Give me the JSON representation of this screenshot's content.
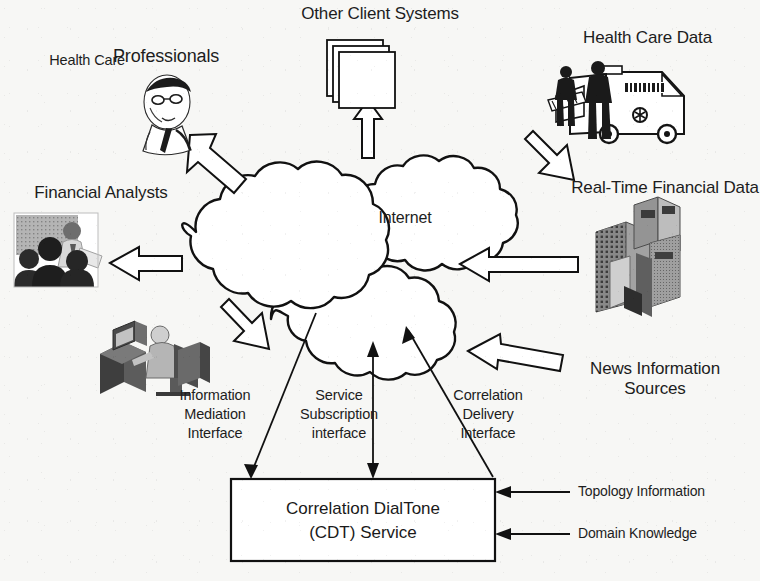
{
  "diagram": {
    "title_text": "Correlation DialTone architecture",
    "center": {
      "cloud_label": "Internet"
    },
    "nodes": [
      {
        "id": "other-client-systems",
        "label": "Other Client Systems",
        "icon": "stacked-windows-icon"
      },
      {
        "id": "health-care-professionals-small",
        "label": "Health Care"
      },
      {
        "id": "health-care-professionals-big",
        "label": "Professionals",
        "icon": "doctor-portrait-icon"
      },
      {
        "id": "health-care-data",
        "label": "Health Care Data",
        "icon": "ambulance-icon"
      },
      {
        "id": "financial-analysts",
        "label": "Financial Analysts",
        "icon": "analysts-photo-icon"
      },
      {
        "id": "real-time-financial-data",
        "label": "Real-Time Financial Data",
        "icon": "office-buildings-icon"
      },
      {
        "id": "news-information-sources",
        "label": "News Information\nSources"
      },
      {
        "id": "information-mediation-user",
        "icon": "desktop-user-icon"
      }
    ],
    "interfaces": [
      {
        "id": "information-mediation-interface",
        "label": "Information\nMediation\nInterface"
      },
      {
        "id": "service-subscription-interface",
        "label": "Service\nSubscription\ninterface"
      },
      {
        "id": "correlation-delivery-interface",
        "label": "Correlation\nDelivery\nInterface"
      }
    ],
    "service_box": {
      "label": "Correlation DialTone\n(CDT) Service"
    },
    "inputs": [
      {
        "id": "topology-information",
        "label": "Topology Information"
      },
      {
        "id": "domain-knowledge",
        "label": "Domain Knowledge"
      }
    ],
    "colors": {
      "background": "#f7f7f5",
      "ink": "#1a1a1a",
      "stroke": "#111111",
      "fill": "#ffffff",
      "gray_mid": "#8c8c8c",
      "gray_dark": "#4a4a4a"
    }
  }
}
